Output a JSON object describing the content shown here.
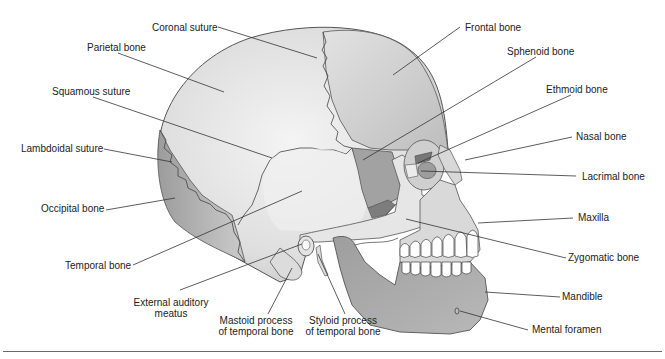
{
  "figure": {
    "labels": {
      "coronal_suture": "Coronal suture",
      "parietal_bone": "Parietal bone",
      "squamous_suture": "Squamous suture",
      "lambdoidal_suture": "Lambdoidal suture",
      "occipital_bone": "Occipital bone",
      "temporal_bone": "Temporal bone",
      "external_auditory_meatus": "External auditory meatus",
      "mastoid_process": "Mastoid process of temporal bone",
      "styloid_process": "Styloid process of temporal bone",
      "frontal_bone": "Frontal bone",
      "sphenoid_bone": "Sphenoid bone",
      "ethmoid_bone": "Ethmoid bone",
      "nasal_bone": "Nasal bone",
      "lacrimal_bone": "Lacrimal bone",
      "maxilla": "Maxilla",
      "zygomatic_bone": "Zygomatic bone",
      "mandible": "Mandible",
      "mental_foramen": "Mental foramen"
    },
    "colors": {
      "cranium_light": "#e6e6e6",
      "cranium_mid": "#cfcfcf",
      "occipital": "#b4b4b4",
      "sphenoid": "#9a9a9a",
      "mandible": "#a8a8a8",
      "outline": "#555555",
      "leader_line": "#333333",
      "text": "#222222"
    }
  }
}
